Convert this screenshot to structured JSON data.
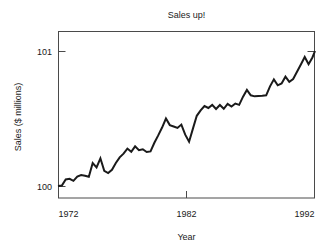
{
  "chart_data": {
    "type": "line",
    "title": "Sales up!",
    "xlabel": "Year",
    "ylabel": "Sales ($ millions)",
    "xlim": [
      1972,
      1992
    ],
    "ylim": [
      99.93,
      101.06
    ],
    "xticks": [
      1972,
      1982,
      1992
    ],
    "xticklabels": [
      "1972",
      "1982",
      "1992"
    ],
    "yticks": [
      100,
      101
    ],
    "yticklabels": [
      "100",
      "101"
    ],
    "grid": false,
    "legend": null,
    "line_color": "#1a1a1a",
    "axis_color": "#4a4a4a",
    "background_color": "#ffffff",
    "series": [
      {
        "name": "Sales",
        "x": [
          1972.0,
          1972.3,
          1972.6,
          1972.9,
          1973.2,
          1973.5,
          1973.8,
          1974.1,
          1974.4,
          1974.7,
          1975.0,
          1975.3,
          1975.6,
          1975.9,
          1976.2,
          1976.5,
          1976.8,
          1977.1,
          1977.4,
          1977.7,
          1978.0,
          1978.3,
          1978.6,
          1978.9,
          1979.2,
          1979.5,
          1979.8,
          1980.1,
          1980.4,
          1980.7,
          1981.0,
          1981.3,
          1981.6,
          1981.9,
          1982.2,
          1982.5,
          1982.8,
          1983.1,
          1983.4,
          1983.7,
          1984.0,
          1984.3,
          1984.6,
          1984.9,
          1985.2,
          1985.5,
          1985.8,
          1986.1,
          1986.4,
          1986.7,
          1987.0,
          1987.3,
          1987.6,
          1987.9,
          1988.2,
          1988.5,
          1988.8,
          1989.1,
          1989.4,
          1989.7,
          1990.0,
          1990.3,
          1990.6,
          1990.9,
          1991.2,
          1991.5,
          1991.8,
          1992.0
        ],
        "y": [
          100.0,
          100.004,
          100.048,
          100.053,
          100.038,
          100.07,
          100.081,
          100.076,
          100.068,
          100.17,
          100.138,
          100.205,
          100.112,
          100.096,
          100.12,
          100.17,
          100.212,
          100.24,
          100.277,
          100.253,
          100.294,
          100.265,
          100.272,
          100.252,
          100.256,
          100.32,
          100.375,
          100.433,
          100.5,
          100.451,
          100.441,
          100.43,
          100.455,
          100.38,
          100.328,
          100.425,
          100.52,
          100.56,
          100.592,
          100.578,
          100.601,
          100.57,
          100.6,
          100.572,
          100.608,
          100.588,
          100.611,
          100.601,
          100.662,
          100.712,
          100.672,
          100.664,
          100.666,
          100.668,
          100.672,
          100.738,
          100.79,
          100.746,
          100.76,
          100.81,
          100.772,
          100.792,
          100.846,
          100.9,
          100.956,
          100.902,
          100.952,
          101.0
        ]
      }
    ]
  },
  "plot_geometry": {
    "frame_left": 58,
    "frame_right": 315,
    "frame_top": 31,
    "frame_bottom": 198,
    "y_pixel_for_101": 51,
    "y_pixel_for_100": 186,
    "x_pixel_for_1972": 58,
    "x_pixel_for_1982": 186.5,
    "x_pixel_for_1992": 315
  }
}
